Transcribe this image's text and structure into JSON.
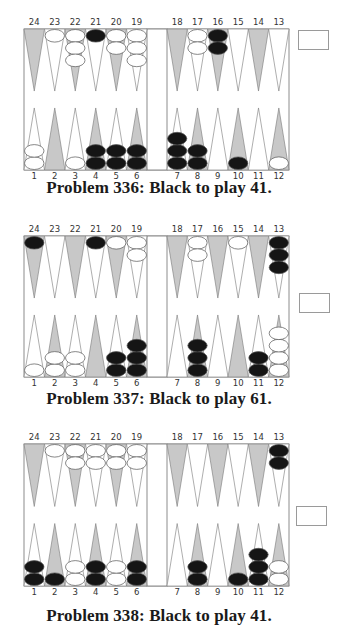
{
  "colors": {
    "dark_point": "#c8c8c8",
    "light_point": "#ffffff",
    "board_border": "#8c8c8c",
    "black_checker": "#151515",
    "white_checker": "#ffffff",
    "checker_outline": "#555555"
  },
  "problems": [
    {
      "number": 336,
      "caption": "Problem 336:  Black to play 41.",
      "top_labels": [
        "24",
        "23",
        "22",
        "21",
        "20",
        "19",
        "18",
        "17",
        "16",
        "15",
        "14",
        "13"
      ],
      "bottom_labels": [
        "1",
        "2",
        "3",
        "4",
        "5",
        "6",
        "7",
        "8",
        "9",
        "10",
        "11",
        "12"
      ],
      "cube_position": "top",
      "points": {
        "1": {
          "color": "white",
          "count": 2
        },
        "3": {
          "color": "white",
          "count": 1
        },
        "4": {
          "color": "black",
          "count": 2
        },
        "5": {
          "color": "black",
          "count": 2
        },
        "6": {
          "color": "black",
          "count": 2
        },
        "7": {
          "color": "black",
          "count": 3
        },
        "8": {
          "color": "black",
          "count": 2
        },
        "10": {
          "color": "black",
          "count": 1
        },
        "12": {
          "color": "white",
          "count": 1
        },
        "16": {
          "color": "black",
          "count": 2
        },
        "17": {
          "color": "white",
          "count": 2
        },
        "19": {
          "color": "white",
          "count": 3
        },
        "20": {
          "color": "white",
          "count": 2
        },
        "21": {
          "color": "black",
          "count": 1
        },
        "22": {
          "color": "white",
          "count": 3
        },
        "23": {
          "color": "white",
          "count": 1
        }
      }
    },
    {
      "number": 337,
      "caption": "Problem 337:  Black to play 61.",
      "top_labels": [
        "24",
        "23",
        "22",
        "21",
        "20",
        "19",
        "18",
        "17",
        "16",
        "15",
        "14",
        "13"
      ],
      "bottom_labels": [
        "1",
        "2",
        "3",
        "4",
        "5",
        "6",
        "7",
        "8",
        "9",
        "10",
        "11",
        "12"
      ],
      "cube_position": "middle",
      "points": {
        "1": {
          "color": "white",
          "count": 1
        },
        "2": {
          "color": "white",
          "count": 2
        },
        "3": {
          "color": "white",
          "count": 2
        },
        "5": {
          "color": "black",
          "count": 2
        },
        "6": {
          "color": "black",
          "count": 3
        },
        "8": {
          "color": "black",
          "count": 3
        },
        "11": {
          "color": "black",
          "count": 2
        },
        "12": {
          "color": "white",
          "count": 4
        },
        "13": {
          "color": "black",
          "count": 3
        },
        "15": {
          "color": "white",
          "count": 1
        },
        "17": {
          "color": "white",
          "count": 2
        },
        "19": {
          "color": "white",
          "count": 2
        },
        "20": {
          "color": "white",
          "count": 1
        },
        "21": {
          "color": "black",
          "count": 1
        },
        "24": {
          "color": "black",
          "count": 1
        }
      }
    },
    {
      "number": 338,
      "caption": "Problem 338:  Black to play 41.",
      "top_labels": [
        "24",
        "23",
        "22",
        "21",
        "20",
        "19",
        "18",
        "17",
        "16",
        "15",
        "14",
        "13"
      ],
      "bottom_labels": [
        "1",
        "2",
        "3",
        "4",
        "5",
        "6",
        "7",
        "8",
        "9",
        "10",
        "11",
        "12"
      ],
      "cube_position": "middle",
      "points": {
        "1": {
          "color": "black",
          "count": 2
        },
        "2": {
          "color": "black",
          "count": 1
        },
        "3": {
          "color": "white",
          "count": 2
        },
        "4": {
          "color": "black",
          "count": 2
        },
        "5": {
          "color": "white",
          "count": 2
        },
        "6": {
          "color": "black",
          "count": 2
        },
        "8": {
          "color": "black",
          "count": 2
        },
        "10": {
          "color": "black",
          "count": 1
        },
        "11": {
          "color": "black",
          "count": 3
        },
        "12": {
          "color": "white",
          "count": 2
        },
        "13": {
          "color": "black",
          "count": 2
        },
        "19": {
          "color": "white",
          "count": 2
        },
        "20": {
          "color": "white",
          "count": 2
        },
        "21": {
          "color": "white",
          "count": 2
        },
        "22": {
          "color": "white",
          "count": 2
        },
        "23": {
          "color": "white",
          "count": 1
        }
      }
    }
  ]
}
